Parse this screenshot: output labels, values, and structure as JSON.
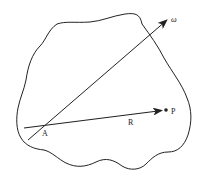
{
  "diagram": {
    "type": "rigid-body-rotation",
    "colors": {
      "stroke": "#222222",
      "background": "#ffffff"
    },
    "labels": {
      "omega": "ω",
      "point_p": "P",
      "point_a": "A",
      "vector_r": "R"
    },
    "elements": {
      "body_outline": "irregular closed body",
      "rotation_axis": "ω axis passing through A",
      "position_vector": "R from A to P"
    }
  }
}
